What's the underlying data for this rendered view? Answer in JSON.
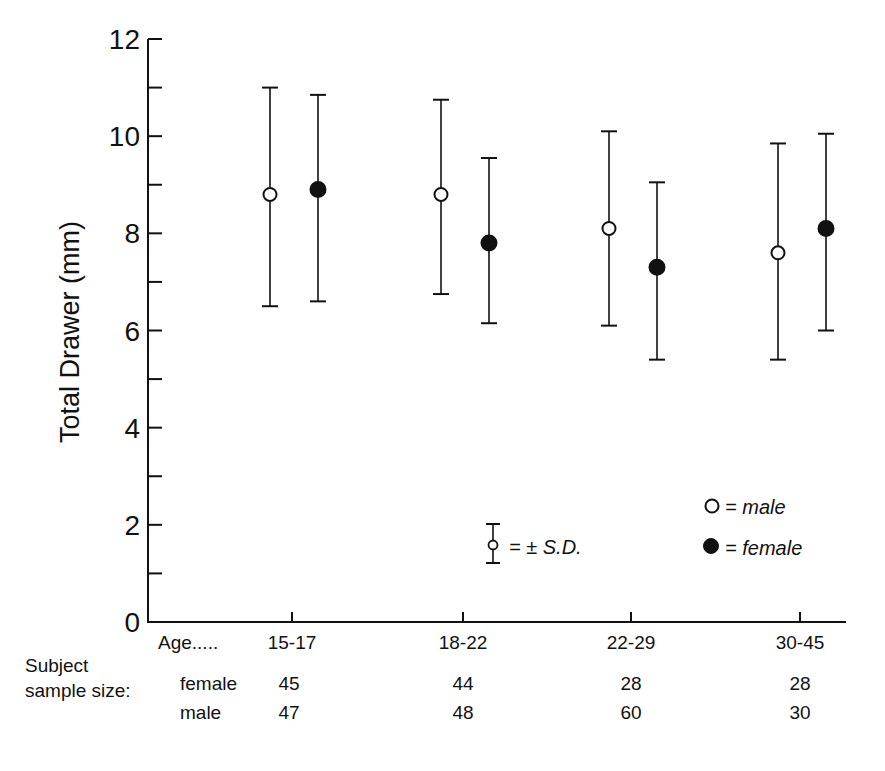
{
  "chart_data": {
    "type": "scatter",
    "subtype": "dot-with-error-bars",
    "title": "",
    "xlabel": "Age.....",
    "ylabel": "Total Drawer (mm)",
    "ylim": [
      0,
      12
    ],
    "yticks": [
      0,
      2,
      4,
      6,
      8,
      10,
      12
    ],
    "yminor_ticks": [
      1,
      3,
      5,
      7,
      9,
      11
    ],
    "grid": false,
    "categories": [
      "15-17",
      "18-22",
      "22-29",
      "30-45"
    ],
    "series": [
      {
        "name": "male",
        "marker": "open-circle",
        "mean": [
          8.8,
          8.8,
          8.1,
          7.6
        ],
        "sd_upper": [
          11.0,
          10.75,
          10.1,
          9.85
        ],
        "sd_lower": [
          6.5,
          6.75,
          6.1,
          5.4
        ]
      },
      {
        "name": "female",
        "marker": "filled-circle",
        "mean": [
          8.9,
          7.8,
          7.3,
          8.1
        ],
        "sd_upper": [
          10.85,
          9.55,
          9.05,
          10.05
        ],
        "sd_lower": [
          6.6,
          6.15,
          5.4,
          6.0
        ]
      }
    ],
    "legend": {
      "position": "lower-right",
      "entries": [
        {
          "marker": "open-circle",
          "label": "= male"
        },
        {
          "marker": "filled-circle",
          "label": "= female"
        }
      ],
      "error_bar_key": "= ± S.D."
    },
    "sample_size": {
      "label_line1": "Subject",
      "label_line2": "sample size:",
      "female_label": "female",
      "male_label": "male",
      "female": [
        45,
        44,
        28,
        28
      ],
      "male": [
        47,
        48,
        60,
        30
      ]
    }
  }
}
